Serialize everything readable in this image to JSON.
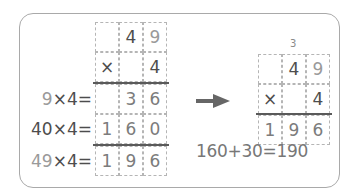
{
  "left": {
    "multiplicand": [
      "",
      "4",
      "9"
    ],
    "multiplier_row": [
      "×",
      "",
      "4"
    ],
    "partial_ones": [
      "",
      "3",
      "6"
    ],
    "partial_tens": [
      "1",
      "6",
      "0"
    ],
    "result": [
      "1",
      "9",
      "6"
    ],
    "labels": [
      {
        "a": "9",
        "rest": "×4="
      },
      {
        "a": "40",
        "rest": "×4="
      },
      {
        "a": "49",
        "rest": "×4="
      }
    ]
  },
  "right": {
    "carry": "3",
    "multiplicand": [
      "",
      "4",
      "9"
    ],
    "multiplier_row": [
      "×",
      "",
      "4"
    ],
    "result": [
      "1",
      "9",
      "6"
    ],
    "equation": "160+30=190"
  },
  "arrow": "right-arrow-icon",
  "colors": {
    "dark": "#4d4d4d",
    "mid": "#7c7c7c",
    "light": "#9a9a9a",
    "border": "#a9a9a9"
  }
}
